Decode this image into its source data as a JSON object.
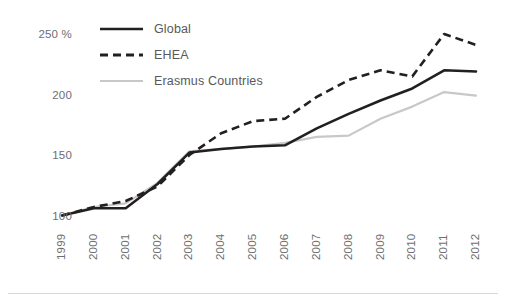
{
  "chart_data": {
    "type": "line",
    "title": "",
    "subtitle": "",
    "xlabel": "",
    "ylabel": "",
    "x": [
      "1999",
      "2000",
      "2001",
      "2002",
      "2003",
      "2004",
      "2005",
      "2006",
      "2007",
      "2008",
      "2009",
      "2010",
      "2011",
      "2012"
    ],
    "categories": [
      "1999",
      "2000",
      "2001",
      "2002",
      "2003",
      "2004",
      "2005",
      "2006",
      "2007",
      "2008",
      "2009",
      "2010",
      "2011",
      "2012"
    ],
    "ylim": [
      88,
      262
    ],
    "xlim": [
      1999,
      2012
    ],
    "yticks": [
      100,
      150,
      200,
      250
    ],
    "ytick_labels": [
      "100",
      "150",
      "200",
      "250 %"
    ],
    "grid": false,
    "legend_position": "top-left",
    "series": [
      {
        "name": "Global",
        "style": "solid",
        "color": "#231f20",
        "width": 2.6,
        "values": [
          100,
          106,
          106,
          126,
          152,
          155,
          157,
          158,
          172,
          184,
          195,
          205,
          220,
          219
        ]
      },
      {
        "name": "EHEA",
        "style": "dashed",
        "color": "#231f20",
        "width": 2.6,
        "values": [
          100,
          107,
          112,
          124,
          150,
          168,
          178,
          180,
          198,
          212,
          220,
          215,
          250,
          241
        ]
      },
      {
        "name": "Erasmus Countries",
        "style": "solid",
        "color": "#c7c8ca",
        "width": 2.2,
        "values": [
          100,
          107,
          110,
          127,
          153,
          155,
          157,
          160,
          165,
          166,
          180,
          190,
          202,
          199
        ]
      }
    ]
  },
  "axes": {
    "y_unit_suffix": " %"
  },
  "legend": {
    "items": [
      {
        "label": "Global",
        "swatch": "solid-dark-line-icon"
      },
      {
        "label": "EHEA",
        "swatch": "dashed-dark-line-icon"
      },
      {
        "label": "Erasmus Countries",
        "swatch": "solid-gray-line-icon"
      }
    ]
  },
  "colors": {
    "series_dark": "#231f20",
    "series_gray": "#c7c8ca",
    "tick_text": "#6d6e71",
    "legend_text": "#58595b",
    "rule": "#d9d9d9",
    "background": "#ffffff"
  }
}
